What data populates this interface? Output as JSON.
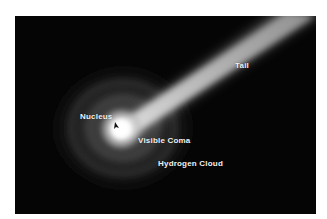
{
  "figure": {
    "background_color": "#050505",
    "label_color": "#f2f2f2",
    "labels": [
      {
        "id": "nucleus",
        "text": "Nucleus"
      },
      {
        "id": "visible-coma",
        "text": "Visible Coma"
      },
      {
        "id": "hydrogen-cloud",
        "text": "Hydrogen Cloud"
      },
      {
        "id": "tail",
        "text": "Tail"
      }
    ]
  }
}
